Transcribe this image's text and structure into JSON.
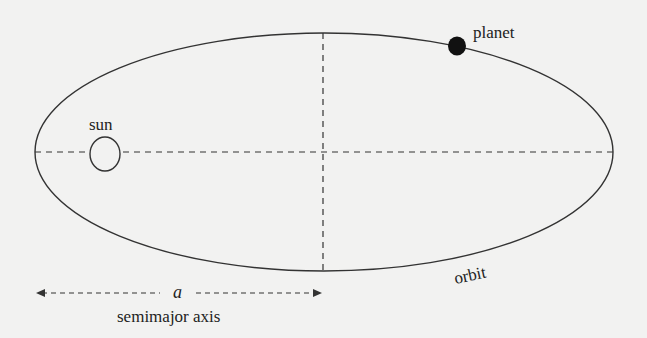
{
  "diagram": {
    "labels": {
      "planet": "planet",
      "sun": "sun",
      "orbit": "orbit",
      "semimajor_symbol": "a",
      "semimajor_caption": "semimajor axis"
    },
    "geometry": {
      "ellipse": {
        "cx": 324,
        "cy": 152,
        "rx": 289,
        "ry": 119
      },
      "sun": {
        "cx": 105,
        "cy": 154,
        "rx": 15,
        "ry": 17
      },
      "planet": {
        "cx": 457,
        "cy": 46,
        "r": 9
      }
    },
    "colors": {
      "background": "#f2f2f1",
      "stroke": "#333333",
      "planet_fill": "#111111"
    }
  }
}
